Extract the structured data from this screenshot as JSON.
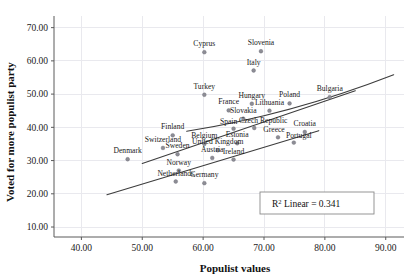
{
  "chart_data": {
    "type": "scatter",
    "title": "",
    "xlabel": "Populist values",
    "ylabel": "Voted for more populist party",
    "xlim": [
      35.5,
      93.0
    ],
    "ylim": [
      7.0,
      73.5
    ],
    "xticks": [
      "40.00",
      "50.00",
      "60.00",
      "70.00",
      "80.00",
      "90.00"
    ],
    "xtick_values": [
      40,
      50,
      60,
      70,
      80,
      90
    ],
    "yticks": [
      "10.00",
      "20.00",
      "30.00",
      "40.00",
      "50.00",
      "60.00",
      "70.00"
    ],
    "ytick_values": [
      10,
      20,
      30,
      40,
      50,
      60,
      70
    ],
    "grid": true,
    "legend": "none",
    "annotation": {
      "r2_prefix": "R",
      "r2_sup": "2",
      "r2_text": " Linear = 0.341",
      "full_text": "R² Linear = 0.341"
    },
    "points": [
      {
        "label": "Cyprus",
        "x": 60.2,
        "y": 62.6,
        "label_dx": 0,
        "label_dy": -6
      },
      {
        "label": "Slovenia",
        "x": 69.5,
        "y": 62.9,
        "label_dx": 0,
        "label_dy": -6
      },
      {
        "label": "Italy",
        "x": 68.3,
        "y": 57.1,
        "label_dx": 0,
        "label_dy": -6
      },
      {
        "label": "Turkey",
        "x": 60.2,
        "y": 49.8,
        "label_dx": 0,
        "label_dy": -6
      },
      {
        "label": "Hungary",
        "x": 68.0,
        "y": 47.1,
        "label_dx": 0,
        "label_dy": -6
      },
      {
        "label": "Poland",
        "x": 74.2,
        "y": 47.2,
        "label_dx": 0,
        "label_dy": -6
      },
      {
        "label": "Bulgaria",
        "x": 80.8,
        "y": 49.1,
        "label_dx": 0,
        "label_dy": -6
      },
      {
        "label": "France",
        "x": 64.2,
        "y": 45.1,
        "label_dx": 0,
        "label_dy": -6
      },
      {
        "label": "Lithuania",
        "x": 70.9,
        "y": 45.0,
        "label_dx": 0,
        "label_dy": -6
      },
      {
        "label": "Slovakia",
        "x": 66.6,
        "y": 42.6,
        "label_dx": 0,
        "label_dy": -6
      },
      {
        "label": "Spain",
        "x": 65.0,
        "y": 39.6,
        "label_dx": -5,
        "label_dy": -5
      },
      {
        "label": "Czech Republic",
        "x": 68.4,
        "y": 39.8,
        "label_dx": 9,
        "label_dy": -5
      },
      {
        "label": "Croatia",
        "x": 76.7,
        "y": 38.6,
        "label_dx": 0,
        "label_dy": -6
      },
      {
        "label": "Greece",
        "x": 72.3,
        "y": 37.0,
        "label_dx": -4,
        "label_dy": -5
      },
      {
        "label": "Portugal",
        "x": 74.9,
        "y": 35.4,
        "label_dx": 5,
        "label_dy": -5
      },
      {
        "label": "Finland",
        "x": 55.0,
        "y": 37.6,
        "label_dx": 0,
        "label_dy": -6
      },
      {
        "label": "Belgium",
        "x": 60.2,
        "y": 35.0,
        "label_dx": 0,
        "label_dy": -6
      },
      {
        "label": "Estonia",
        "x": 65.6,
        "y": 35.2,
        "label_dx": 0,
        "label_dy": -6
      },
      {
        "label": "United Kingdom",
        "x": 62.4,
        "y": 33.1,
        "label_dx": 0,
        "label_dy": -6
      },
      {
        "label": "Switzerland",
        "x": 53.4,
        "y": 33.8,
        "label_dx": 0,
        "label_dy": -6
      },
      {
        "label": "Sweden",
        "x": 55.8,
        "y": 31.9,
        "label_dx": 0,
        "label_dy": -6
      },
      {
        "label": "Denmark",
        "x": 47.6,
        "y": 30.4,
        "label_dx": 0,
        "label_dy": -6
      },
      {
        "label": "Austria",
        "x": 61.5,
        "y": 30.8,
        "label_dx": 0,
        "label_dy": -6
      },
      {
        "label": "Ireland",
        "x": 65.0,
        "y": 30.3,
        "label_dx": 0,
        "label_dy": -6
      },
      {
        "label": "Norway",
        "x": 56.0,
        "y": 27.0,
        "label_dx": 0,
        "label_dy": -6
      },
      {
        "label": "Netherlands",
        "x": 55.5,
        "y": 23.7,
        "label_dx": 0,
        "label_dy": -6
      },
      {
        "label": "Germany",
        "x": 60.2,
        "y": 23.2,
        "label_dx": 0,
        "label_dy": -6
      }
    ],
    "fit_lines": [
      {
        "name": "upper-fit",
        "x0": 57.3,
        "y0": 38.8,
        "x1": 91.3,
        "y1": 55.8,
        "curved": true
      },
      {
        "name": "middle-fit",
        "x0": 50.0,
        "y0": 29.1,
        "x1": 85.0,
        "y1": 51.0,
        "curved": false
      },
      {
        "name": "lower-fit",
        "x0": 44.2,
        "y0": 19.7,
        "x1": 79.0,
        "y1": 39.0,
        "curved": false
      }
    ]
  }
}
